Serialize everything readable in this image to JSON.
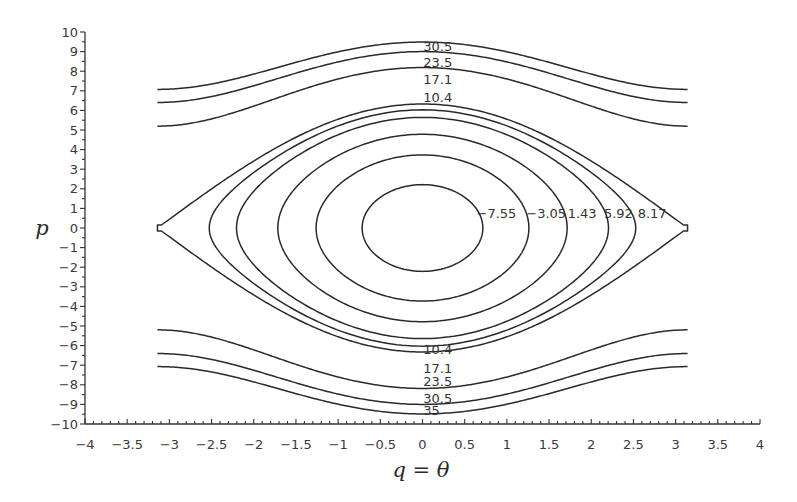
{
  "chart_data": {
    "type": "contour",
    "title": "",
    "xlabel": "q = θ",
    "ylabel": "p",
    "xlim": [
      -4,
      4
    ],
    "ylim": [
      -10,
      10
    ],
    "grid": false,
    "legend": null,
    "function": "H(q, p) = p^2/2 - 10 cos(q)",
    "k": 10,
    "q_domain": [
      -3.14159,
      3.14159
    ],
    "levels": [
      -7.55,
      -3.05,
      1.43,
      5.92,
      8.17,
      10.4,
      17.1,
      23.5,
      30.5,
      35
    ],
    "curves": [
      {
        "level": -7.55,
        "kind": "closed"
      },
      {
        "level": -3.05,
        "kind": "closed"
      },
      {
        "level": 1.43,
        "kind": "closed"
      },
      {
        "level": 5.92,
        "kind": "closed"
      },
      {
        "level": 8.17,
        "kind": "closed"
      },
      {
        "level": 10.4,
        "kind": "separatrix"
      },
      {
        "level": 23.5,
        "kind": "open"
      },
      {
        "level": 30.5,
        "kind": "open"
      },
      {
        "level": 35,
        "kind": "open"
      }
    ],
    "contour_labels": [
      {
        "text": "30.5",
        "q": 0.01,
        "p": 9.28
      },
      {
        "text": "23.5",
        "q": 0.01,
        "p": 8.46
      },
      {
        "text": "17.1",
        "q": 0.01,
        "p": 7.59
      },
      {
        "text": "10.4",
        "q": 0.01,
        "p": 6.67
      },
      {
        "text": "10.4",
        "q": 0.01,
        "p": -6.2
      },
      {
        "text": "17.1",
        "q": 0.01,
        "p": -7.18
      },
      {
        "text": "23.5",
        "q": 0.01,
        "p": -7.85
      },
      {
        "text": "30.5",
        "q": 0.01,
        "p": -8.72
      },
      {
        "text": "35",
        "q": 0.01,
        "p": -9.33
      },
      {
        "text": "−7.55",
        "q": 0.64,
        "p": 0.72
      },
      {
        "text": "−3.05",
        "q": 1.23,
        "p": 0.72
      },
      {
        "text": "1.43",
        "q": 1.72,
        "p": 0.72
      },
      {
        "text": "5.92",
        "q": 2.15,
        "p": 0.72
      },
      {
        "text": "8.17",
        "q": 2.55,
        "p": 0.72
      }
    ],
    "xticks": {
      "values": [
        -4,
        -3.5,
        -3,
        -2.5,
        -2,
        -1.5,
        -1,
        -0.5,
        0,
        0.5,
        1,
        1.5,
        2,
        2.5,
        3,
        3.5,
        4
      ],
      "labels": [
        "−4",
        "−3.5",
        "−3",
        "−2.5",
        "−2",
        "−1.5",
        "−1",
        "−0.5",
        "0",
        "0.5",
        "1",
        "1.5",
        "2",
        "2.5",
        "3",
        "3.5",
        "4"
      ],
      "minor_step": 0.1
    },
    "yticks": {
      "values": [
        10,
        9,
        8,
        7,
        6,
        5,
        4,
        3,
        2,
        1,
        0,
        -1,
        -2,
        -3,
        -4,
        -5,
        -6,
        -7,
        -8,
        -9,
        -10
      ],
      "labels": [
        "10",
        "9",
        "8",
        "7",
        "6",
        "5",
        "4",
        "3",
        "2",
        "1",
        "0",
        "−1",
        "−2",
        "−3",
        "−4",
        "−5",
        "−6",
        "−7",
        "−8",
        "−9",
        "−10"
      ],
      "minor_step": 0.5
    },
    "colors": {
      "line": "#2a2a2a",
      "text": "#333333",
      "background": "#ffffff"
    }
  }
}
